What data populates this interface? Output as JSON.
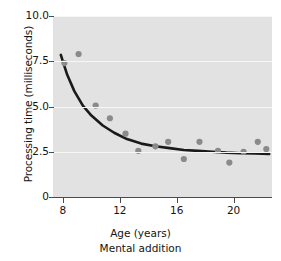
{
  "chart_data": {
    "type": "scatter",
    "title": "",
    "caption": "Mental addition",
    "xlabel": "Age (years)",
    "ylabel": "Processing time (milliseconds)",
    "xlim": [
      7.3,
      22.7
    ],
    "ylim": [
      0,
      10.0
    ],
    "xticks": [
      8,
      12,
      16,
      20
    ],
    "xtick_labels": [
      "8",
      "12",
      "16",
      "20"
    ],
    "yticks": [
      0,
      2.5,
      5.0,
      7.5,
      10.0
    ],
    "ytick_labels": [
      "0",
      "2.5",
      "5.0",
      "7.5",
      "10.0"
    ],
    "grid": true,
    "grid_axis": "y",
    "legend": "none",
    "panel_color": "#e2e2e2",
    "grid_color": "#f7f7f7",
    "point_color": "#8a8a8a",
    "curve_color": "#1a1a1a",
    "points": [
      {
        "x": 8.1,
        "y": 7.4
      },
      {
        "x": 9.1,
        "y": 7.9
      },
      {
        "x": 10.3,
        "y": 5.05
      },
      {
        "x": 11.3,
        "y": 4.35
      },
      {
        "x": 12.4,
        "y": 3.5
      },
      {
        "x": 13.3,
        "y": 2.55
      },
      {
        "x": 14.5,
        "y": 2.8
      },
      {
        "x": 15.4,
        "y": 3.05
      },
      {
        "x": 16.5,
        "y": 2.1
      },
      {
        "x": 17.6,
        "y": 3.05
      },
      {
        "x": 18.9,
        "y": 2.55
      },
      {
        "x": 19.7,
        "y": 1.9
      },
      {
        "x": 20.7,
        "y": 2.5
      },
      {
        "x": 21.7,
        "y": 3.05
      },
      {
        "x": 22.3,
        "y": 2.65
      }
    ],
    "fit_curve": {
      "label": "exponential-decay-fit",
      "points": [
        {
          "x": 7.85,
          "y": 7.85
        },
        {
          "x": 8.3,
          "y": 6.75
        },
        {
          "x": 8.8,
          "y": 5.85
        },
        {
          "x": 9.4,
          "y": 5.05
        },
        {
          "x": 10.0,
          "y": 4.5
        },
        {
          "x": 10.8,
          "y": 3.95
        },
        {
          "x": 11.6,
          "y": 3.55
        },
        {
          "x": 12.5,
          "y": 3.2
        },
        {
          "x": 13.5,
          "y": 2.95
        },
        {
          "x": 14.5,
          "y": 2.8
        },
        {
          "x": 15.5,
          "y": 2.7
        },
        {
          "x": 16.5,
          "y": 2.6
        },
        {
          "x": 17.5,
          "y": 2.55
        },
        {
          "x": 18.5,
          "y": 2.5
        },
        {
          "x": 19.5,
          "y": 2.45
        },
        {
          "x": 20.5,
          "y": 2.42
        },
        {
          "x": 21.5,
          "y": 2.4
        },
        {
          "x": 22.5,
          "y": 2.38
        }
      ]
    }
  }
}
